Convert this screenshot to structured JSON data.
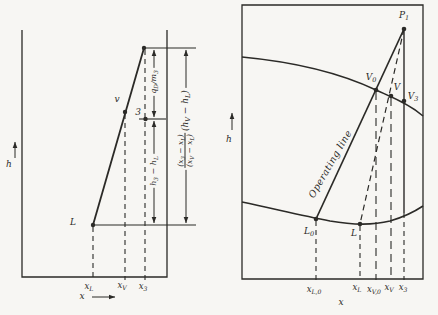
{
  "colors": {
    "ink": "#2b2a27",
    "paper": "#f7f6f3"
  },
  "left_diagram": {
    "h_axis_label": "h",
    "x_axis_label": "x",
    "point_labels": {
      "L": "L",
      "V": "v",
      "three": "3"
    },
    "x_ticks": {
      "xL": [
        "x",
        {
          "sub": "L"
        }
      ],
      "xV": [
        "x",
        {
          "sub": "V"
        }
      ],
      "x3": [
        "x",
        {
          "sub": "3"
        }
      ]
    },
    "dimensions": {
      "qd_over_m3": [
        "q",
        {
          "sub": "D"
        },
        "/m",
        {
          "sub": "3"
        }
      ],
      "h3_minus_hL": [
        "h",
        {
          "sub": "3"
        },
        " − h",
        {
          "sub": "L"
        }
      ],
      "ratio_num": [
        "(x",
        {
          "sub": "3"
        },
        " − x",
        {
          "sub": "L"
        },
        ")"
      ],
      "ratio_den": [
        "(x",
        {
          "sub": "V"
        },
        " − x",
        {
          "sub": "L"
        },
        ")"
      ],
      "ratio_factor": [
        "(h",
        {
          "sub": "V"
        },
        " − h",
        {
          "sub": "L"
        },
        ")"
      ]
    }
  },
  "right_diagram": {
    "h_axis_label": "h",
    "x_axis_label": "x",
    "operating_line_label": "Operating line",
    "point_labels": {
      "P1": [
        "P",
        {
          "sub": "1"
        }
      ],
      "V0": [
        "V",
        {
          "sub": "0"
        }
      ],
      "V": "V",
      "V3": [
        "V",
        {
          "sub": "3"
        }
      ],
      "L0": [
        "L",
        {
          "sub": "0"
        }
      ],
      "L": "L"
    },
    "x_ticks": {
      "xL0": [
        "x",
        {
          "sub": "L,0"
        }
      ],
      "xL": [
        "x",
        {
          "sub": "L"
        }
      ],
      "xV0": [
        "x",
        {
          "sub": "V,0"
        }
      ],
      "xV": [
        "x",
        {
          "sub": "V"
        }
      ],
      "x3": [
        "x",
        {
          "sub": "3"
        }
      ]
    }
  }
}
